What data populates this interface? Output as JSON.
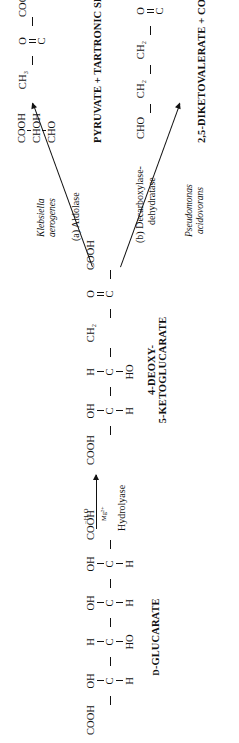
{
  "diagram": {
    "substrate": {
      "name": "D-GLUCARATE",
      "name_prefix": "D",
      "name_rest": "-GLUCARATE",
      "carbons": [
        {
          "top": "COOH",
          "bottom": "",
          "core": ""
        },
        {
          "top": "OH",
          "bottom": "H",
          "core": "C"
        },
        {
          "top": "H",
          "bottom": "HO",
          "core": "C"
        },
        {
          "top": "OH",
          "bottom": "H",
          "core": "C"
        },
        {
          "top": "OH",
          "bottom": "H",
          "core": "C"
        },
        {
          "top": "COOH",
          "bottom": "",
          "core": ""
        }
      ]
    },
    "step1": {
      "enzyme": "Hydrolyase",
      "above_arrow": "−H₂O",
      "below_arrow": "Mg²⁺"
    },
    "intermediate": {
      "name_line1": "4-DEOXY-",
      "name_line2": "5-KETOGLUCARATE",
      "carbons": [
        {
          "top": "COOH",
          "bottom": "",
          "core": ""
        },
        {
          "top": "OH",
          "bottom": "H",
          "core": "C"
        },
        {
          "top": "H",
          "bottom": "HO",
          "core": "C"
        },
        {
          "top": "CH₂",
          "bottom": "",
          "core": ""
        },
        {
          "top": "O",
          "bottom": "",
          "core": "C",
          "double_up": true
        },
        {
          "top": "COOH",
          "bottom": "",
          "core": ""
        }
      ]
    },
    "branch_a": {
      "enzyme_label": "(a)  Aldolase",
      "organism_line1": "Klebsiella",
      "organism_line2": "aerogenes",
      "product_name": "PYRUVATE + TARTRONIC SEMIALDEHYDE",
      "product_structures": [
        {
          "id": "pyruvate",
          "carbons": [
            {
              "top": "CH₃",
              "bottom": "",
              "core": ""
            },
            {
              "top": "O",
              "bottom": "",
              "core": "C",
              "double_up": true
            },
            {
              "top": "COOH",
              "bottom": "",
              "core": ""
            }
          ]
        },
        {
          "id": "tartronic-semialdehyde",
          "carbons": [
            {
              "top": "COOH",
              "bottom": "",
              "core": ""
            },
            {
              "top": "CHOH",
              "bottom": "",
              "core": ""
            },
            {
              "top": "CHO",
              "bottom": "",
              "core": ""
            }
          ]
        }
      ]
    },
    "branch_b": {
      "enzyme_line1": "(b)  Decarboxylase-",
      "enzyme_line2": "dehydratase",
      "organism_line1": "Pseudomonas",
      "organism_line2": "acidovorans",
      "product_name": "2,5-DIKETOVALERATE + CO₂ + H₂O",
      "product_structures": [
        {
          "id": "2-5-diketovalerate",
          "carbons": [
            {
              "top": "CHO",
              "bottom": "",
              "core": ""
            },
            {
              "top": "CH₂",
              "bottom": "",
              "core": ""
            },
            {
              "top": "CH₂",
              "bottom": "",
              "core": ""
            },
            {
              "top": "O",
              "bottom": "",
              "core": "C",
              "double_up": true
            },
            {
              "top": "COOH",
              "bottom": "",
              "core": ""
            }
          ]
        }
      ]
    },
    "colors": {
      "ink": "#111111",
      "background": "#ffffff"
    }
  }
}
